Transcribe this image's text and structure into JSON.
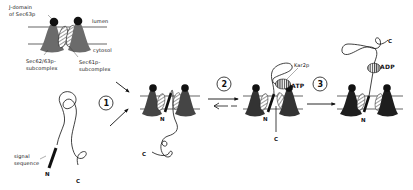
{
  "diagram": {
    "title": "",
    "legend_panel": {
      "labels": {
        "j_domain_line1": "J-domain",
        "j_domain_line2": "of Sec63p",
        "lumen": "lumen",
        "cytosol": "cytosol",
        "sec62_63_line1": "Sec62/63p-",
        "sec62_63_line2": "subcomplex",
        "sec61_line1": "Sec61p-",
        "sec61_line2": "subcomplex"
      }
    },
    "precursor": {
      "signal_line1": "signal",
      "signal_line2": "sequence",
      "n_terminus": "N",
      "c_terminus": "C"
    },
    "steps": [
      {
        "number": "1",
        "description": "precursor and translocon associate"
      },
      {
        "number": "2",
        "description": "reversible insertion, Kar2p binds ATP"
      },
      {
        "number": "3",
        "description": "ATP hydrolysis, Kar2p-ADP traps chain"
      }
    ],
    "stage1": {
      "n_terminus": "N",
      "c_terminus": "C"
    },
    "stage2": {
      "n_terminus": "N",
      "c_terminus": "C",
      "chaperone": "Kar2p",
      "nucleotide": "ATP"
    },
    "stage3": {
      "n_terminus": "N",
      "c_terminus": "C",
      "nucleotide": "ADP"
    },
    "colors": {
      "sec62_63_gray": "#6b6b6b",
      "sec62_63_dark": "#2b2b2b",
      "membrane_line": "#222222",
      "background": "#ffffff"
    }
  }
}
